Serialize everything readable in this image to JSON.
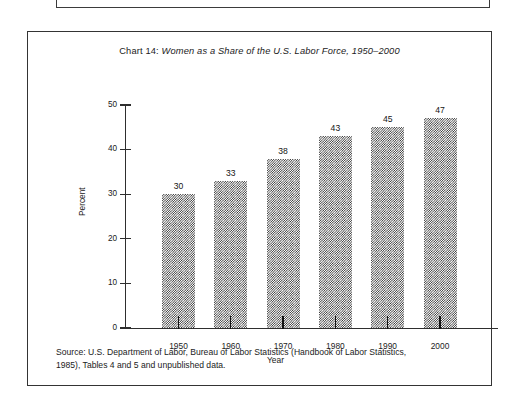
{
  "figure": {
    "title_lead": "Chart 14:",
    "title_italic": "Women as a Share of the U.S. Labor Force, 1950–2000",
    "source_line1": "Source: U.S. Department of Labor, Bureau of Labor Statistics (Handbook of Labor Statistics,",
    "source_line2": "1985), Tables 4 and 5 and unpublished data."
  },
  "chart_data": {
    "type": "bar",
    "title": "Chart 14: Women as a Share of the U.S. Labor Force, 1950–2000",
    "categories": [
      "1950",
      "1960",
      "1970",
      "1980",
      "1990",
      "2000"
    ],
    "values": [
      30,
      33,
      38,
      43,
      45,
      47
    ],
    "data_labels": [
      "30",
      "33",
      "38",
      "43",
      "45",
      "47"
    ],
    "xlabel": "Year",
    "ylabel": "Percent",
    "ylim": [
      0,
      50
    ],
    "yticks": [
      0,
      10,
      20,
      30,
      40,
      50
    ],
    "ytick_labels": [
      "0",
      "10",
      "20",
      "30",
      "40",
      "50"
    ],
    "grid": false,
    "legend": false,
    "bar_fill": "#2b2b2b",
    "bar_fill_style": "50% checkerboard dither",
    "axis_color": "#2e2e2e"
  }
}
